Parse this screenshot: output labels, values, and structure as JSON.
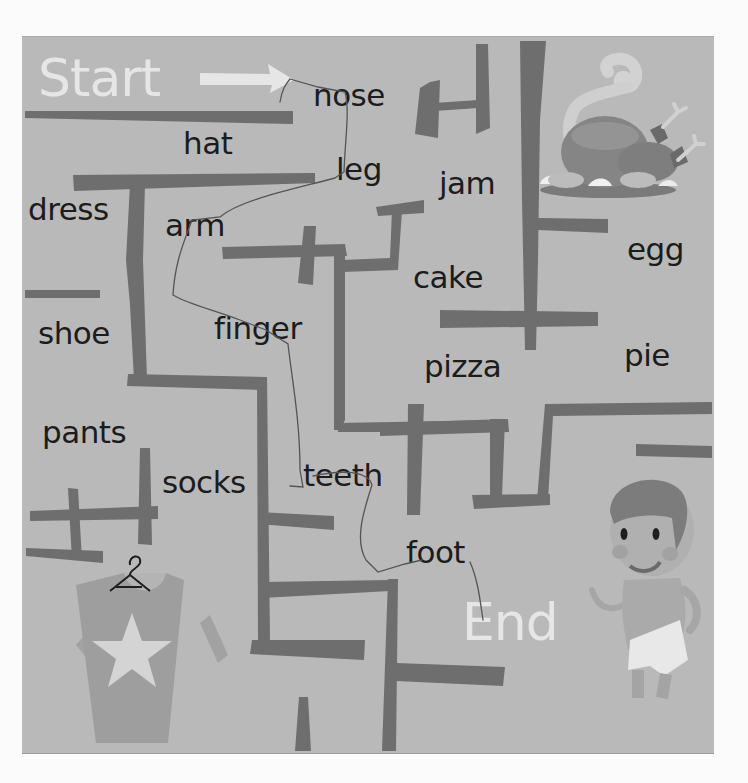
{
  "puzzle": {
    "type": "word-maze",
    "start_label": "Start",
    "end_label": "End",
    "colors": {
      "page_background": "#fbfbfb",
      "board_background": "#b9b9b9",
      "wall": "#6e6e6e",
      "word_text": "#1c1c1c",
      "start_end_text": "#e6e6e6",
      "path_line": "#5a5a5a"
    },
    "words": [
      {
        "id": "nose",
        "text": "nose",
        "x": 313,
        "y": 80
      },
      {
        "id": "hat",
        "text": "hat",
        "x": 183,
        "y": 128
      },
      {
        "id": "leg",
        "text": "leg",
        "x": 336,
        "y": 154
      },
      {
        "id": "jam",
        "text": "jam",
        "x": 439,
        "y": 168
      },
      {
        "id": "dress",
        "text": "dress",
        "x": 28,
        "y": 194
      },
      {
        "id": "arm",
        "text": "arm",
        "x": 165,
        "y": 210
      },
      {
        "id": "egg",
        "text": "egg",
        "x": 627,
        "y": 234
      },
      {
        "id": "cake",
        "text": "cake",
        "x": 413,
        "y": 262
      },
      {
        "id": "shoe",
        "text": "shoe",
        "x": 38,
        "y": 318
      },
      {
        "id": "finger",
        "text": "finger",
        "x": 214,
        "y": 313
      },
      {
        "id": "pie",
        "text": "pie",
        "x": 624,
        "y": 340
      },
      {
        "id": "pizza",
        "text": "pizza",
        "x": 424,
        "y": 351
      },
      {
        "id": "pants",
        "text": "pants",
        "x": 42,
        "y": 417
      },
      {
        "id": "teeth",
        "text": "teeth",
        "x": 303,
        "y": 460
      },
      {
        "id": "socks",
        "text": "socks",
        "x": 162,
        "y": 467
      },
      {
        "id": "foot",
        "text": "foot",
        "x": 406,
        "y": 537
      }
    ],
    "solution_path": [
      "Start",
      "nose",
      "leg",
      "arm",
      "finger",
      "teeth",
      "foot",
      "End"
    ],
    "illustrations": [
      "roast-turkey",
      "shirt-on-hanger",
      "boy-in-shorts"
    ]
  }
}
